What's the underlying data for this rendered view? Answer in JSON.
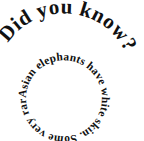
{
  "canvas": {
    "width": 144,
    "height": 141,
    "background_color": "#ffffff",
    "text_color": "#111111"
  },
  "headline": {
    "text": "Did you know?",
    "style": "bold-serif-arc",
    "arc": "upper-left to right, clockwise"
  },
  "body": {
    "text": "Asian elephants have white skin. Some very rare",
    "full_sentence": "Some very rare Asian elephants have white skin.",
    "style": "bold-serif-circle",
    "arc": "full circle, clockwise"
  }
}
